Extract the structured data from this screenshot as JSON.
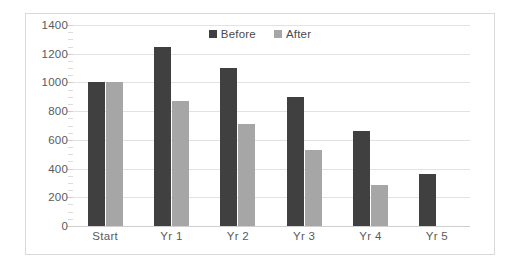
{
  "chart_data": {
    "type": "bar",
    "title": "",
    "xlabel": "",
    "ylabel": "",
    "categories": [
      "Start",
      "Yr 1",
      "Yr 2",
      "Yr 3",
      "Yr 4",
      "Yr 5"
    ],
    "series": [
      {
        "name": "Before",
        "color": "#404040",
        "values": [
          1000,
          1250,
          1100,
          900,
          665,
          360
        ]
      },
      {
        "name": "After",
        "color": "#a6a6a6",
        "values": [
          1000,
          870,
          710,
          530,
          285,
          0
        ]
      }
    ],
    "ylim": [
      0,
      1400
    ],
    "ytick_labels": [
      "0",
      "200",
      "400",
      "600",
      "800",
      "1000",
      "1200",
      "1400"
    ],
    "ytick_values": [
      0,
      200,
      400,
      600,
      800,
      1000,
      1200,
      1400
    ],
    "grid": true,
    "legend_position": "top-center",
    "plot_background": "#ffffff",
    "border_color": "#d9d9d9",
    "gridline_color": "#e2e2e2",
    "tick_label_color": "#5a5a5a"
  },
  "legend": {
    "entries": [
      {
        "label": "Before"
      },
      {
        "label": "After"
      }
    ]
  }
}
